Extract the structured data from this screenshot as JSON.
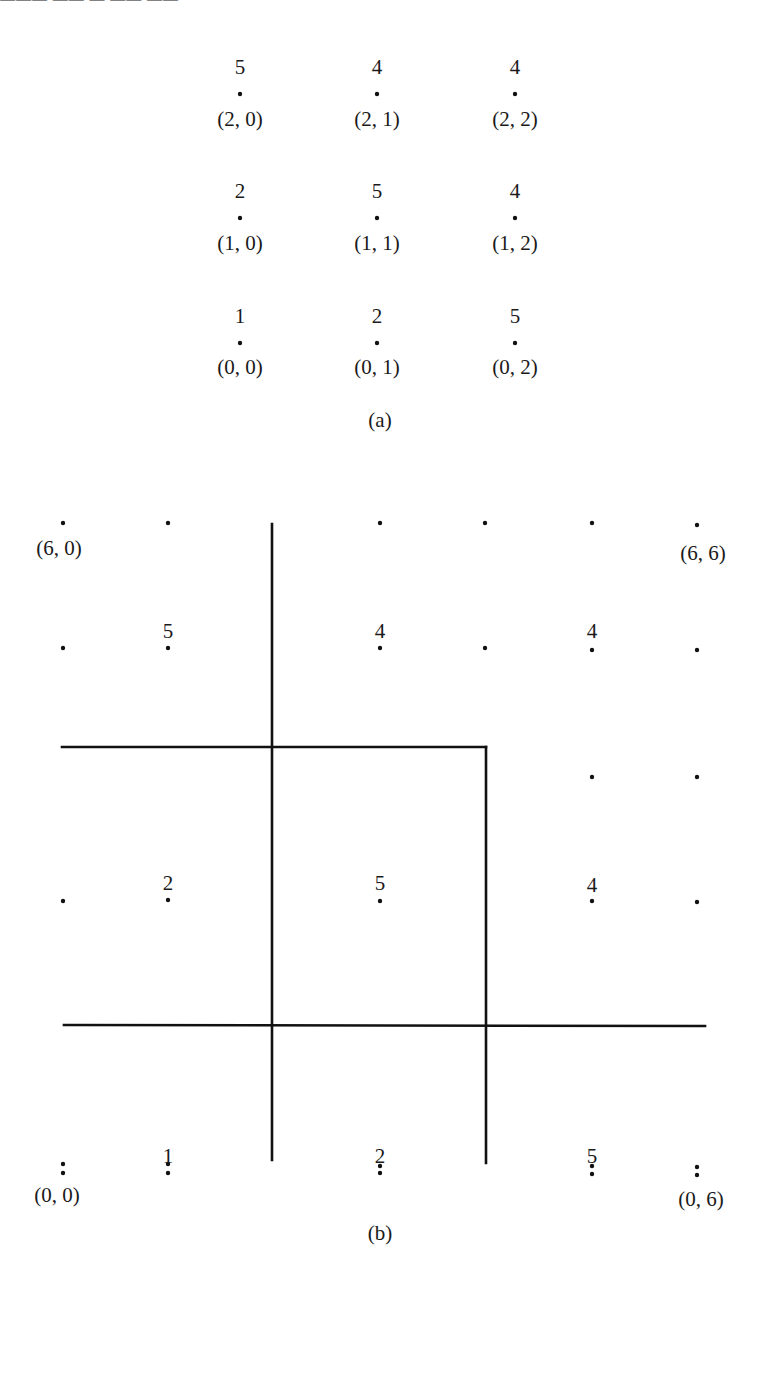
{
  "header_fragment": "——— —— — —— ——",
  "figure_a": {
    "caption": "(a)",
    "columns_x": [
      240,
      377,
      515
    ],
    "rows": [
      {
        "value_y": 74,
        "dot_y": 94,
        "coord_y": 126,
        "cells": [
          {
            "value": "5",
            "coord": "(2, 0)"
          },
          {
            "value": "4",
            "coord": "(2, 1)"
          },
          {
            "value": "4",
            "coord": "(2, 2)"
          }
        ]
      },
      {
        "value_y": 198,
        "dot_y": 218,
        "coord_y": 250,
        "cells": [
          {
            "value": "2",
            "coord": "(1, 0)"
          },
          {
            "value": "5",
            "coord": "(1, 1)"
          },
          {
            "value": "4",
            "coord": "(1, 2)"
          }
        ]
      },
      {
        "value_y": 323,
        "dot_y": 343,
        "coord_y": 374,
        "cells": [
          {
            "value": "1",
            "coord": "(0, 0)"
          },
          {
            "value": "2",
            "coord": "(0, 1)"
          },
          {
            "value": "5",
            "coord": "(0, 2)"
          }
        ]
      }
    ],
    "caption_y": 427
  },
  "figure_b": {
    "caption": "(b)",
    "caption_y": 1240,
    "dot_columns_x": [
      63,
      168,
      380,
      485,
      592,
      697
    ],
    "dots": [
      [
        63,
        523
      ],
      [
        168,
        523
      ],
      [
        380,
        523
      ],
      [
        485,
        523
      ],
      [
        592,
        523
      ],
      [
        697,
        525
      ],
      [
        63,
        648
      ],
      [
        168,
        648
      ],
      [
        380,
        648
      ],
      [
        485,
        648
      ],
      [
        592,
        650
      ],
      [
        697,
        650
      ],
      [
        592,
        777
      ],
      [
        697,
        777
      ],
      [
        63,
        901
      ],
      [
        168,
        900
      ],
      [
        380,
        901
      ],
      [
        592,
        901
      ],
      [
        697,
        902
      ],
      [
        63,
        1173
      ],
      [
        168,
        1173
      ],
      [
        380,
        1173
      ],
      [
        592,
        1174
      ],
      [
        697,
        1175
      ],
      [
        63,
        1164
      ],
      [
        168,
        1164
      ],
      [
        380,
        1166
      ],
      [
        592,
        1166
      ],
      [
        697,
        1167
      ]
    ],
    "values": [
      {
        "text": "5",
        "x": 168,
        "y": 638
      },
      {
        "text": "4",
        "x": 380,
        "y": 638
      },
      {
        "text": "4",
        "x": 592,
        "y": 638
      },
      {
        "text": "2",
        "x": 168,
        "y": 890
      },
      {
        "text": "5",
        "x": 380,
        "y": 890
      },
      {
        "text": "4",
        "x": 592,
        "y": 892
      },
      {
        "text": "1",
        "x": 168,
        "y": 1163
      },
      {
        "text": "2",
        "x": 380,
        "y": 1163
      },
      {
        "text": "5",
        "x": 592,
        "y": 1163
      }
    ],
    "corner_labels": [
      {
        "text": "(6, 0)",
        "x": 59,
        "y": 555
      },
      {
        "text": "(6, 6)",
        "x": 703,
        "y": 560
      },
      {
        "text": "(0, 0)",
        "x": 57,
        "y": 1202
      },
      {
        "text": "(0, 6)",
        "x": 701,
        "y": 1206
      }
    ],
    "partition_lines": [
      {
        "x1": 272,
        "y1": 524,
        "x2": 272,
        "y2": 1160
      },
      {
        "x1": 62,
        "y1": 747,
        "x2": 486,
        "y2": 747
      },
      {
        "x1": 486,
        "y1": 747,
        "x2": 486,
        "y2": 1163
      },
      {
        "x1": 64,
        "y1": 1025,
        "x2": 705,
        "y2": 1026
      }
    ]
  }
}
